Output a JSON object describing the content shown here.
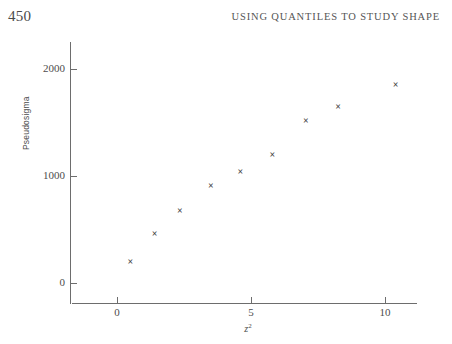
{
  "page": {
    "folio": "450",
    "running_head": "USING QUANTILES TO STUDY SHAPE"
  },
  "chart_data": {
    "type": "scatter",
    "title": "",
    "xlabel": "z²",
    "xlabel_base": "z",
    "xlabel_exponent": "2",
    "ylabel": "Pseudosigma",
    "xlim": [
      -0.8,
      11.5
    ],
    "ylim": [
      -190,
      2190
    ],
    "xticks": [
      0,
      5,
      10
    ],
    "xticklabels": [
      "0",
      "5",
      "10"
    ],
    "yticks": [
      0,
      1000,
      2000
    ],
    "yticklabels": [
      "0",
      "1000",
      "2000"
    ],
    "grid": false,
    "legend": false,
    "marker": "x",
    "marker_glyph": "×",
    "marker_color": "#3b3b3b",
    "axis_color": "#6d6d6d",
    "series": [
      {
        "name": "Pseudosigma vs z²",
        "points": [
          {
            "x": 0.5,
            "y": 200
          },
          {
            "x": 1.4,
            "y": 460
          },
          {
            "x": 2.35,
            "y": 675
          },
          {
            "x": 3.5,
            "y": 905
          },
          {
            "x": 4.6,
            "y": 1040
          },
          {
            "x": 5.8,
            "y": 1200
          },
          {
            "x": 7.05,
            "y": 1515
          },
          {
            "x": 8.25,
            "y": 1645
          },
          {
            "x": 10.4,
            "y": 1850
          }
        ]
      }
    ]
  }
}
